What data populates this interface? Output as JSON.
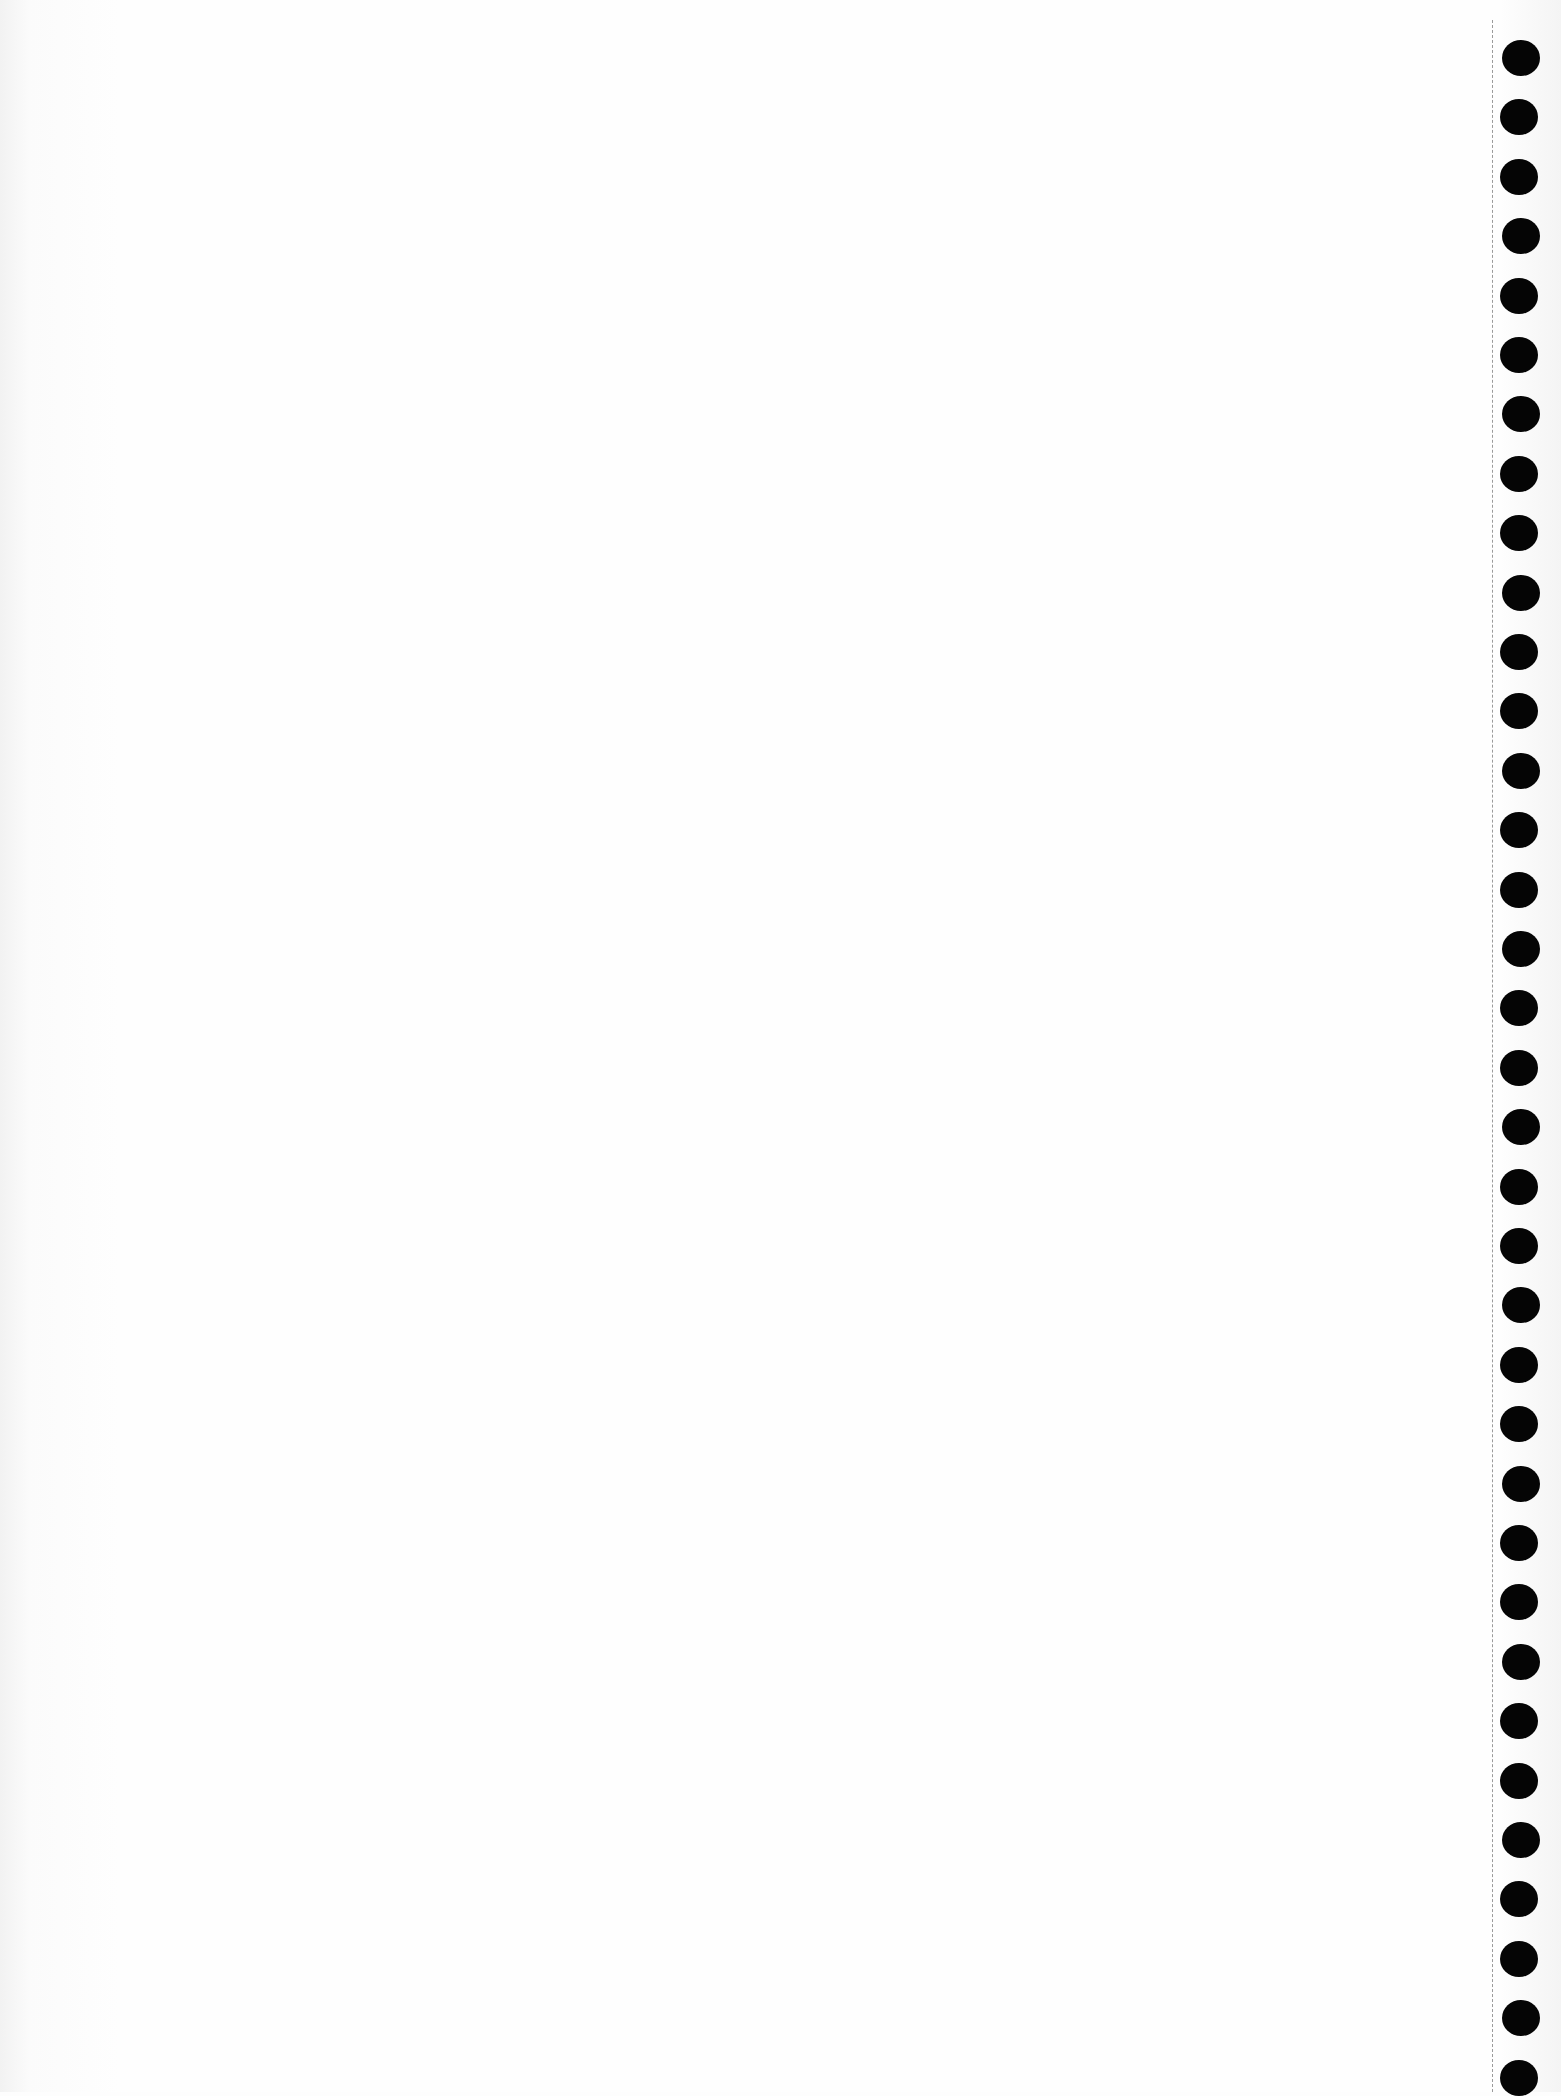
{
  "page": {
    "type": "blank notebook page",
    "text_content": "",
    "background_color": "#fdfdfd"
  },
  "binding": {
    "hole_count": 35,
    "hole_color": "#050505",
    "perforation_style": "dashed",
    "perforation_color": "#9a9a9a"
  }
}
